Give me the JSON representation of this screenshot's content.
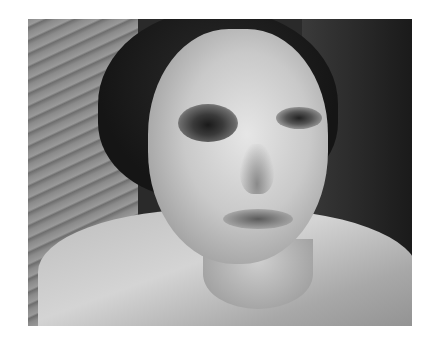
{
  "image": {
    "subject": "grayscale photo of a woman with a bruised left eye",
    "colors": {
      "background": "#ffffff",
      "photo_dark": "#1a1a1a",
      "skin_light": "#e6e6e6",
      "bruise": "#1a1a1a"
    },
    "frame": {
      "left": 28,
      "top": 19,
      "width": 384,
      "height": 307
    }
  }
}
